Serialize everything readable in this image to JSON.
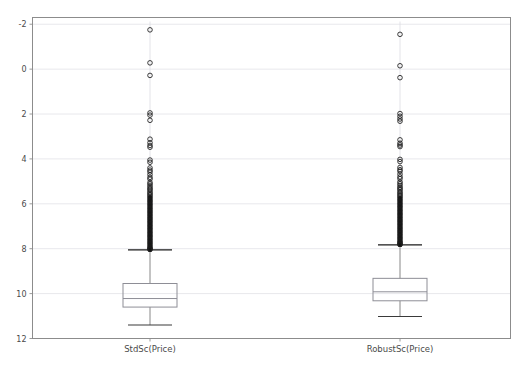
{
  "figure": {
    "title": "",
    "caption": "",
    "background_color": "#ffffff",
    "frame_color": "#8c8c8c",
    "grid_color": "#e8e8ec",
    "line_color": "#7a7a7a",
    "text_color": "#4a4a4a"
  },
  "chart_data": {
    "type": "box",
    "title": "",
    "xlabel": "",
    "ylabel": "",
    "ylim": [
      -2,
      12.3
    ],
    "yticks": [
      -2,
      0,
      2,
      4,
      6,
      8,
      10,
      12
    ],
    "ytick_labels": [
      "-2",
      "0",
      "2",
      "4",
      "6",
      "8",
      "10",
      "12"
    ],
    "grid": true,
    "grid_axis": "y",
    "legend": "none",
    "categories": [
      "StdSc(Price)",
      "RobustSc(Price)"
    ],
    "boxes": [
      {
        "label": "StdSc(Price)",
        "x_center_px": 150,
        "q1": -0.6,
        "median": -0.22,
        "q3": 0.45,
        "whisker_low": -1.4,
        "whisker_high": 1.95,
        "box_width_units": 1.0,
        "outliers": [
          11.75,
          10.28,
          9.72,
          8.05,
          7.95,
          7.72,
          6.88,
          6.72,
          6.6,
          6.52,
          5.95,
          5.85,
          5.6,
          5.5,
          5.42,
          5.3,
          5.18,
          5.1,
          4.95,
          4.88,
          4.8,
          4.72,
          4.66,
          4.6,
          4.52,
          4.46,
          4.4,
          4.34,
          4.28,
          4.22,
          4.16,
          4.1,
          4.04,
          3.98,
          3.92,
          3.86,
          3.8,
          3.74,
          3.68,
          3.62,
          3.56,
          3.5,
          3.44,
          3.38,
          3.32,
          3.26,
          3.2,
          3.14,
          3.08,
          3.02,
          2.96,
          2.9,
          2.84,
          2.78,
          2.72,
          2.66,
          2.6,
          2.54,
          2.48,
          2.42,
          2.36,
          2.3,
          2.24,
          2.18,
          2.12,
          2.06,
          2.02,
          1.99,
          1.97
        ]
      },
      {
        "label": "RobustSc(Price)",
        "x_center_px": 400,
        "q1": -0.32,
        "median": 0.08,
        "q3": 0.68,
        "whisker_low": -1.02,
        "whisker_high": 2.17,
        "box_width_units": 1.0,
        "outliers": [
          11.55,
          10.15,
          9.62,
          8.02,
          7.9,
          7.78,
          7.68,
          6.85,
          6.7,
          6.62,
          6.55,
          5.98,
          5.88,
          5.62,
          5.52,
          5.45,
          5.32,
          5.2,
          5.12,
          4.98,
          4.9,
          4.82,
          4.74,
          4.68,
          4.62,
          4.54,
          4.48,
          4.42,
          4.36,
          4.3,
          4.24,
          4.18,
          4.12,
          4.06,
          4.0,
          3.94,
          3.88,
          3.82,
          3.76,
          3.7,
          3.64,
          3.58,
          3.52,
          3.46,
          3.4,
          3.34,
          3.28,
          3.22,
          3.16,
          3.1,
          3.04,
          2.98,
          2.92,
          2.86,
          2.8,
          2.74,
          2.68,
          2.62,
          2.56,
          2.5,
          2.44,
          2.38,
          2.32,
          2.28,
          2.24,
          2.2,
          2.19
        ]
      }
    ]
  },
  "axes": {
    "y_tick_labels": [
      "12",
      "10",
      "8",
      "6",
      "4",
      "2",
      "0",
      "-2"
    ],
    "x_tick_labels": [
      "StdSc(Price)",
      "RobustSc(Price)"
    ]
  }
}
